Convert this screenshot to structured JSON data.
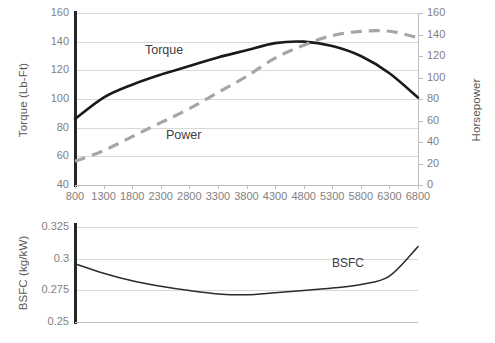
{
  "chart_data": [
    {
      "type": "line",
      "title": "",
      "id": "engine-performance",
      "xlabel": "",
      "ylabel": "Torque (Lb-Ft)",
      "y2label": "Horsepower",
      "grid": true,
      "legend_position": "inline-annotations",
      "x": [
        800,
        1300,
        1800,
        2300,
        2800,
        3300,
        3800,
        4300,
        4800,
        5300,
        5800,
        6300,
        6800
      ],
      "xticklabels": [
        "800",
        "1300",
        "1800",
        "2300",
        "2800",
        "3300",
        "3800",
        "4300",
        "4800",
        "5300",
        "5800",
        "6300",
        "6800"
      ],
      "ylim": [
        40,
        160
      ],
      "yticks": [
        40,
        60,
        80,
        100,
        120,
        140,
        160
      ],
      "yticklabels": [
        "40",
        "60",
        "80",
        "100",
        "120",
        "140",
        "160"
      ],
      "y2lim": [
        0,
        160
      ],
      "y2ticks": [
        0,
        20,
        40,
        60,
        80,
        100,
        120,
        140,
        160
      ],
      "y2ticklabels": [
        "0",
        "20",
        "40",
        "60",
        "80",
        "100",
        "120",
        "140",
        "160"
      ],
      "series": [
        {
          "name": "Torque",
          "axis": "left",
          "style": "solid",
          "color": "#1a1a1a",
          "label_text": "Torque",
          "values": [
            86,
            101,
            110,
            117,
            123,
            129,
            134,
            139,
            140,
            137,
            130,
            118,
            101
          ]
        },
        {
          "name": "Power",
          "axis": "right",
          "style": "dashed",
          "color": "#a6a6a6",
          "label_text": "Power",
          "values": [
            22,
            32,
            45,
            58,
            71,
            86,
            101,
            118,
            130,
            139,
            143,
            143,
            137
          ]
        }
      ]
    },
    {
      "type": "line",
      "title": "",
      "id": "bsfc",
      "xlabel": "",
      "ylabel": "BSFC (kg/kW)",
      "grid": true,
      "legend_position": "inline-annotations",
      "x": [
        800,
        1300,
        1800,
        2300,
        2800,
        3300,
        3800,
        4300,
        4800,
        5300,
        5800,
        6300,
        6800
      ],
      "ylim": [
        0.25,
        0.325
      ],
      "yticks": [
        0.25,
        0.275,
        0.3,
        0.325
      ],
      "yticklabels": [
        "0.25",
        "0.275",
        "0.3",
        "0.325"
      ],
      "series": [
        {
          "name": "BSFC",
          "axis": "left",
          "style": "solid",
          "color": "#2b2b2b",
          "label_text": "BSFC",
          "values": [
            0.296,
            0.2885,
            0.2825,
            0.2782,
            0.2748,
            0.2722,
            0.2715,
            0.2731,
            0.2749,
            0.2768,
            0.2796,
            0.2862,
            0.3095
          ]
        }
      ]
    }
  ]
}
